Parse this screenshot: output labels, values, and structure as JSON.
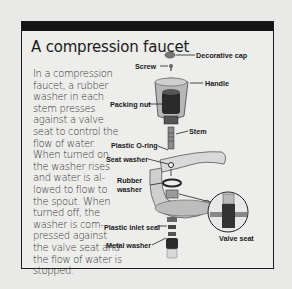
{
  "title": "A compression faucet",
  "description": "In a compression faucet, a rubber washer in each stem presses against a valve seat to control the flow of water. When turned on, the washer rises and water is al-lowed to flow to the spout. When turned off, the washer is com-pressed against the valve seat and the flow of water is stopped.",
  "labels": {
    "decorative_cap": "Decorative cap",
    "screw": "Screw",
    "handle": "Handle",
    "packing_nut": "Packing nut",
    "stem": "Stem",
    "plastic_o_ring": "Plastic O-ring",
    "seat_washer": "Seat washer",
    "rubber_washer_1": "Rubber",
    "rubber_washer_2": "washer",
    "plastic_inlet_seal": "Plastic inlet seal",
    "metal_washer": "Metal washer",
    "valve_seat": "Valve seat"
  },
  "colors": {
    "frame": "#1c1c1c",
    "header_bar": "#151515",
    "background": "#ededeb"
  }
}
